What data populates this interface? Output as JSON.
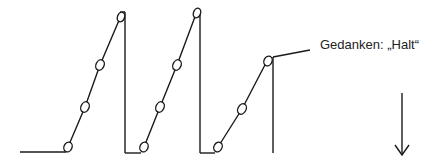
{
  "diagram": {
    "type": "sawtooth-step-diagram",
    "stroke_color": "#1a1a1a",
    "background": "#ffffff",
    "baseline": {
      "from": [
        20,
        152
      ],
      "to": [
        68,
        152
      ]
    },
    "ramps": [
      {
        "points": [
          [
            68,
            147
          ],
          [
            85,
            107
          ],
          [
            100,
            65
          ],
          [
            120,
            18
          ]
        ],
        "drop_x": 125,
        "drop_top": 12,
        "return_to_x": 144
      },
      {
        "points": [
          [
            144,
            147
          ],
          [
            160,
            107
          ],
          [
            177,
            65
          ],
          [
            196,
            14
          ]
        ],
        "drop_x": 200,
        "drop_top": 10,
        "return_to_x": 218
      },
      {
        "points": [
          [
            218,
            147
          ],
          [
            242,
            109
          ],
          [
            267,
            61
          ]
        ],
        "drop_x": 273,
        "drop_top": 57,
        "return_to_x": null
      }
    ],
    "annotation": {
      "text": "Gedanken: „Halt“",
      "leader_from": [
        274,
        57
      ],
      "leader_to": [
        310,
        50
      ]
    },
    "arrow": {
      "direction": "down",
      "x": 402,
      "y_start": 93,
      "y_end": 155
    }
  }
}
